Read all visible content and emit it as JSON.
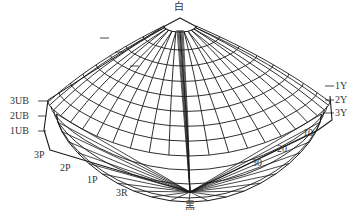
{
  "diagram": {
    "type": "color-solid-mesh",
    "top_label": "白",
    "bottom_label": "黑",
    "left_labels": [
      "3UB",
      "2UB",
      "1UB"
    ],
    "bottom_left_labels": [
      "3P",
      "2P",
      "1P",
      "3R"
    ],
    "right_labels": [
      "1Y",
      "2Y",
      "3Y"
    ],
    "bottom_right_labels": [
      "10",
      "20",
      "30"
    ],
    "colors": {
      "line": "#1a1a1a",
      "text": "#333333",
      "background": "#ffffff"
    }
  }
}
